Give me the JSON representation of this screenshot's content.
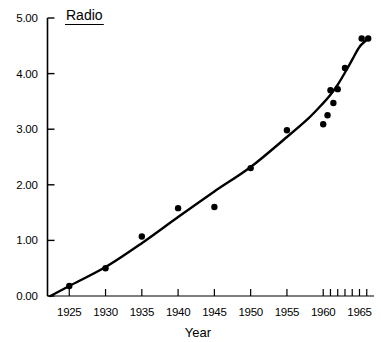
{
  "chart_data": {
    "type": "scatter",
    "title": "Radio",
    "xlabel": "Year",
    "ylabel": "",
    "xlim": [
      1922,
      1967
    ],
    "ylim": [
      0.0,
      5.0
    ],
    "grid": false,
    "legend": null,
    "x_major_ticks": [
      1925,
      1930,
      1935,
      1940,
      1945,
      1950,
      1955,
      1960,
      1961,
      1962,
      1963,
      1964,
      1965,
      1966
    ],
    "x_tick_labels": [
      "1925",
      "1930",
      "1935",
      "1940",
      "1945",
      "1950",
      "1955",
      "1960",
      "1965"
    ],
    "x_labeled_ticks": [
      1925,
      1930,
      1935,
      1940,
      1945,
      1950,
      1955,
      1960,
      1965
    ],
    "y_ticks": [
      0.0,
      1.0,
      2.0,
      3.0,
      4.0,
      5.0
    ],
    "y_tick_labels": [
      "0.00",
      "1.00",
      "2.00",
      "3.00",
      "4.00",
      "5.00"
    ],
    "series": [
      {
        "name": "Radio data points",
        "marker": "filled-circle",
        "x": [
          1925,
          1930,
          1935,
          1940,
          1945,
          1950,
          1955,
          1960,
          1960.6,
          1961,
          1961.4,
          1962,
          1963,
          1965.3,
          1966.2
        ],
        "values": [
          0.18,
          0.5,
          1.07,
          1.58,
          1.6,
          2.3,
          2.98,
          3.09,
          3.25,
          3.7,
          3.47,
          3.72,
          4.1,
          4.63,
          4.63
        ]
      },
      {
        "name": "Fitted curve",
        "marker": "line",
        "x": [
          1922.4,
          1925,
          1930,
          1935,
          1940,
          1945,
          1950,
          1955,
          1958,
          1960,
          1961,
          1962,
          1963,
          1964,
          1965,
          1966.2
        ],
        "values": [
          0.0,
          0.18,
          0.52,
          0.95,
          1.42,
          1.88,
          2.32,
          2.86,
          3.2,
          3.47,
          3.62,
          3.8,
          4.02,
          4.25,
          4.48,
          4.63
        ]
      }
    ],
    "colors": {
      "axis": "#000000",
      "curve": "#000000",
      "marker": "#000000",
      "background": "#ffffff"
    }
  },
  "title_block": {
    "text": "Radio",
    "underlined": true
  },
  "axes": {
    "x_axis_title": "Year",
    "y_axis_title": ""
  }
}
